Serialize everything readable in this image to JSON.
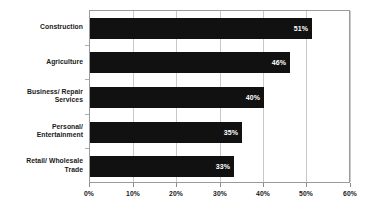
{
  "chart_data": {
    "type": "bar",
    "orientation": "horizontal",
    "title": "",
    "xlabel": "",
    "ylabel": "",
    "categories": [
      "Construction",
      "Agriculture",
      "Business/ Repair Services",
      "Personal/ Entertainment",
      "Retail/ Wholesale Trade"
    ],
    "category_lines": [
      [
        "Construction"
      ],
      [
        "Agriculture"
      ],
      [
        "Business/ Repair",
        "Services"
      ],
      [
        "Personal/",
        "Entertainment"
      ],
      [
        "Retail/ Wholesale",
        "Trade"
      ]
    ],
    "values": [
      51,
      46,
      40,
      35,
      33
    ],
    "value_labels": [
      "51%",
      "46%",
      "40%",
      "35%",
      "33%"
    ],
    "xlim": [
      0,
      60
    ],
    "xticks": [
      0,
      10,
      20,
      30,
      40,
      50,
      60
    ],
    "xtick_labels": [
      "0%",
      "10%",
      "20%",
      "30%",
      "40%",
      "50%",
      "60%"
    ],
    "grid": true,
    "legend": false,
    "bar_color": "#111111",
    "value_label_color": "#ffffff",
    "gridline_color": "#c9c9c9",
    "axis_color": "#9a9a9a",
    "text_color": "#1a1a1a"
  }
}
